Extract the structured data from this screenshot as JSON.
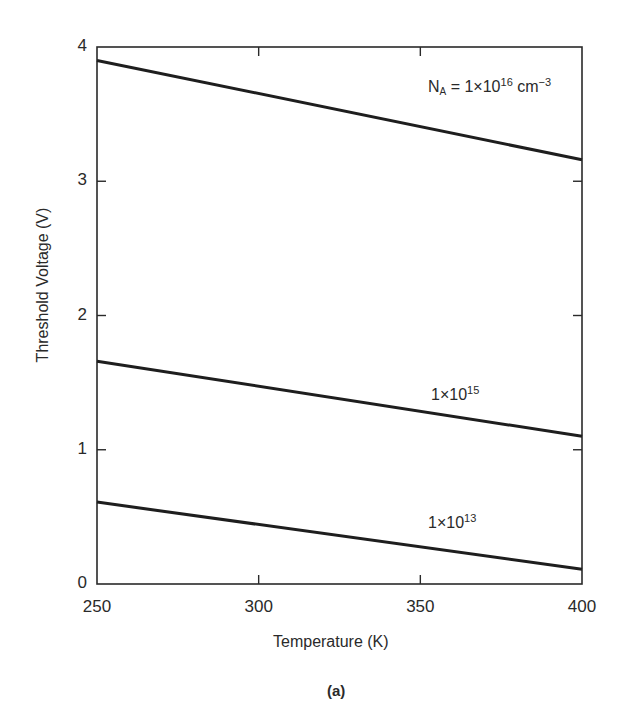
{
  "chart_data": {
    "type": "line",
    "title": "",
    "caption": "(a)",
    "xlabel": "Temperature (K)",
    "ylabel": "Threshold Voltage (V)",
    "xlim": [
      250,
      400
    ],
    "ylim": [
      0,
      4
    ],
    "x_ticks": [
      250,
      300,
      350,
      400
    ],
    "y_ticks": [
      0,
      1,
      2,
      3,
      4
    ],
    "grid": false,
    "legend": "inline labels",
    "x": [
      250,
      400
    ],
    "series": [
      {
        "name": "N_A = 1×10^16 cm^-3",
        "label_main": "N",
        "label_sub": "A",
        "label_mid": " = 1×10",
        "label_exp": "16",
        "label_unit": " cm",
        "label_unit_exp": "−3",
        "values": [
          3.9,
          3.16
        ]
      },
      {
        "name": "1×10^15",
        "label_main": "1×10",
        "label_exp": "15",
        "values": [
          1.66,
          1.1
        ]
      },
      {
        "name": "1×10^13",
        "label_main": "1×10",
        "label_exp": "13",
        "values": [
          0.61,
          0.11
        ]
      }
    ]
  },
  "labels": {
    "y_ticks": [
      "0",
      "1",
      "2",
      "3",
      "4"
    ],
    "x_ticks": [
      "250",
      "300",
      "350",
      "400"
    ]
  },
  "colors": {
    "line": "#1e1e1e",
    "axis": "#2a2a2a",
    "background": "#ffffff"
  }
}
